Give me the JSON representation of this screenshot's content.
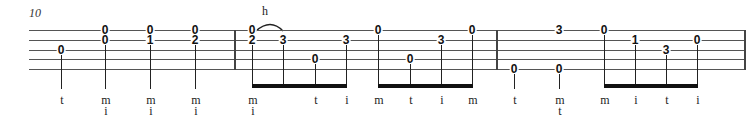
{
  "measure_number": "10",
  "technique_label": "h",
  "strings": 5,
  "staff": {
    "top": 30,
    "spacing": 9.8,
    "left": 29,
    "right": 745
  },
  "bar_lines": [
    235,
    497,
    745
  ],
  "notes": [
    {
      "x": 61,
      "frets": [
        {
          "string": 3,
          "fret": "0"
        }
      ],
      "fingers": [
        "t"
      ],
      "stem": "single"
    },
    {
      "x": 105,
      "frets": [
        {
          "string": 1,
          "fret": "0"
        },
        {
          "string": 2,
          "fret": "0"
        }
      ],
      "fingers": [
        "m",
        "i"
      ],
      "stem": "single"
    },
    {
      "x": 150,
      "frets": [
        {
          "string": 1,
          "fret": "0"
        },
        {
          "string": 2,
          "fret": "1"
        }
      ],
      "fingers": [
        "m",
        "i"
      ],
      "stem": "single"
    },
    {
      "x": 195,
      "frets": [
        {
          "string": 1,
          "fret": "0"
        },
        {
          "string": 2,
          "fret": "2"
        }
      ],
      "fingers": [
        "m",
        "i"
      ],
      "stem": "single"
    },
    {
      "x": 252,
      "frets": [
        {
          "string": 1,
          "fret": "0"
        },
        {
          "string": 2,
          "fret": "2"
        }
      ],
      "fingers": [
        "m",
        "i"
      ],
      "stem": "beam1"
    },
    {
      "x": 283,
      "frets": [
        {
          "string": 2,
          "fret": "3"
        }
      ],
      "fingers": [
        ""
      ],
      "stem": "beam1"
    },
    {
      "x": 315,
      "frets": [
        {
          "string": 4,
          "fret": "0"
        }
      ],
      "fingers": [
        "t"
      ],
      "stem": "beam1"
    },
    {
      "x": 346,
      "frets": [
        {
          "string": 2,
          "fret": "3"
        }
      ],
      "fingers": [
        "i"
      ],
      "stem": "beam1"
    },
    {
      "x": 378,
      "frets": [
        {
          "string": 1,
          "fret": "0"
        }
      ],
      "fingers": [
        "m"
      ],
      "stem": "beam2"
    },
    {
      "x": 410,
      "frets": [
        {
          "string": 4,
          "fret": "0"
        }
      ],
      "fingers": [
        "t"
      ],
      "stem": "beam2"
    },
    {
      "x": 441,
      "frets": [
        {
          "string": 2,
          "fret": "3"
        }
      ],
      "fingers": [
        "i"
      ],
      "stem": "beam2"
    },
    {
      "x": 472,
      "frets": [
        {
          "string": 1,
          "fret": "0"
        }
      ],
      "fingers": [
        "m"
      ],
      "stem": "beam2"
    },
    {
      "x": 514,
      "frets": [
        {
          "string": 5,
          "fret": "0"
        }
      ],
      "fingers": [
        "t"
      ],
      "stem": "single"
    },
    {
      "x": 559,
      "frets": [
        {
          "string": 1,
          "fret": "3"
        },
        {
          "string": 5,
          "fret": "0"
        }
      ],
      "fingers": [
        "m",
        "t"
      ],
      "stem": "single"
    },
    {
      "x": 604,
      "frets": [
        {
          "string": 1,
          "fret": "0"
        }
      ],
      "fingers": [
        "m"
      ],
      "stem": "beam3"
    },
    {
      "x": 635,
      "frets": [
        {
          "string": 2,
          "fret": "1"
        }
      ],
      "fingers": [
        "i"
      ],
      "stem": "beam3"
    },
    {
      "x": 666,
      "frets": [
        {
          "string": 3,
          "fret": "3"
        }
      ],
      "fingers": [
        "t"
      ],
      "stem": "beam3"
    },
    {
      "x": 697,
      "frets": [
        {
          "string": 2,
          "fret": "0"
        }
      ],
      "fingers": [
        "i"
      ],
      "stem": "beam3"
    }
  ],
  "beams": [
    {
      "from": 252,
      "to": 346
    },
    {
      "from": 378,
      "to": 472
    },
    {
      "from": 604,
      "to": 697
    }
  ],
  "hammer_on": {
    "from_x": 252,
    "to_x": 283,
    "label_x": 262
  }
}
